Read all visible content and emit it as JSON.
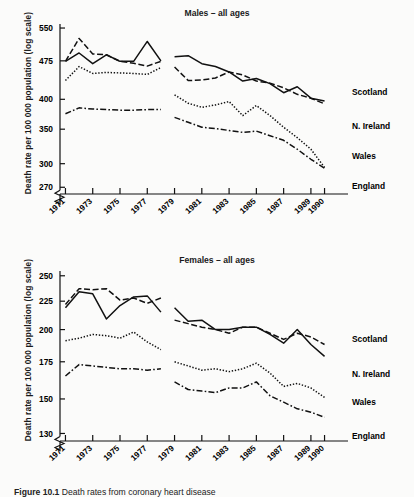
{
  "figure": {
    "caption_label": "Figure 10.1",
    "caption_text": "Death rates from coronary heart disease"
  },
  "series_styles": {
    "Scotland": "solid",
    "N. Ireland": "dashed",
    "Wales": "dotted",
    "England": "dash-dot"
  },
  "panels": {
    "males": {
      "title": "Males – all ages",
      "ylabel": "Death rate per 100 000 population (log scale)",
      "series_labels": [
        "Scotland",
        "N. Ireland",
        "Wales",
        "England"
      ]
    },
    "females": {
      "title": "Females – all ages",
      "ylabel": "Death rate per 100 000 population (log scale)",
      "series_labels": [
        "Scotland",
        "N. Ireland",
        "Wales",
        "England"
      ]
    }
  },
  "chart_data": [
    {
      "type": "line",
      "title": "Males – all ages",
      "xlabel": "",
      "ylabel": "Death rate per 100 000 population (log scale)",
      "yscale": "log",
      "ylim": [
        262,
        560
      ],
      "yticks": [
        270,
        300,
        350,
        400,
        475,
        550
      ],
      "axis_break": true,
      "grid": false,
      "legend": "inline-right",
      "xlim": [
        1970.6,
        1990.4
      ],
      "xticks": [
        1971,
        1973,
        1975,
        1977,
        1979,
        1981,
        1983,
        1985,
        1987,
        1989,
        1990
      ],
      "x": [
        1971,
        1972,
        1973,
        1974,
        1975,
        1976,
        1977,
        1978,
        1979,
        1980,
        1981,
        1982,
        1983,
        1984,
        1985,
        1986,
        1987,
        1988,
        1989,
        1990
      ],
      "data_gap_between": [
        1978,
        1979
      ],
      "series": [
        {
          "name": "Scotland",
          "style": "solid",
          "values": [
            474,
            492,
            469,
            484,
            488,
            473,
            474,
            474,
            518,
            480,
            475,
            483,
            484,
            486,
            465,
            486,
            479,
            484,
            469,
            473,
            463,
            462,
            452,
            434,
            432,
            439,
            429,
            412,
            423,
            402,
            397,
            409,
            396,
            386,
            380,
            376
          ]
        },
        {
          "name": "N. Ireland",
          "style": "dashed",
          "values": [
            474,
            500,
            525,
            500,
            490,
            480,
            488,
            480,
            474,
            470,
            464,
            474,
            466,
            462,
            462,
            474,
            465,
            442,
            433,
            436,
            440,
            435,
            452,
            451,
            446,
            440,
            434,
            430,
            430,
            421,
            424,
            409,
            402,
            400,
            392,
            378
          ]
        },
        {
          "name": "Wales",
          "style": "dotted",
          "values": [
            435,
            455,
            463,
            459,
            449,
            450,
            451,
            450,
            449,
            444,
            447,
            445,
            452,
            461,
            408,
            404,
            393,
            381,
            386,
            390,
            396,
            398,
            372,
            371,
            389,
            380,
            372,
            362,
            353,
            345,
            337,
            329,
            320,
            310,
            300,
            295
          ]
        },
        {
          "name": "England",
          "style": "dash-dot",
          "values": [
            375,
            381,
            385,
            384,
            383,
            383,
            382,
            382,
            382,
            381,
            380,
            381,
            381,
            382,
            369,
            365,
            361,
            357,
            353,
            352,
            351,
            350,
            348,
            347,
            345,
            347,
            345,
            340,
            333,
            327,
            320,
            314,
            306,
            300,
            294,
            288
          ]
        }
      ],
      "series_values_by_year": {
        "Scotland": {
          "1971": 474,
          "1972": 492,
          "1973": 469,
          "1974": 488,
          "1975": 474,
          "1976": 474,
          "1977": 518,
          "1978": 475,
          "1979": 484,
          "1980": 486,
          "1981": 469,
          "1982": 463,
          "1983": 452,
          "1984": 434,
          "1985": 439,
          "1986": 429,
          "1987": 412,
          "1988": 423,
          "1989": 402,
          "1990": 397
        },
        "N. Ireland": {
          "1971": 474,
          "1972": 525,
          "1973": 490,
          "1974": 488,
          "1975": 474,
          "1976": 470,
          "1977": 464,
          "1978": 474,
          "1979": 462,
          "1980": 435,
          "1981": 436,
          "1982": 440,
          "1983": 452,
          "1984": 446,
          "1985": 434,
          "1986": 430,
          "1987": 421,
          "1988": 409,
          "1989": 402,
          "1990": 392
        },
        "Wales": {
          "1971": 435,
          "1972": 463,
          "1973": 449,
          "1974": 451,
          "1975": 450,
          "1976": 449,
          "1977": 447,
          "1978": 461,
          "1979": 408,
          "1980": 393,
          "1981": 386,
          "1982": 390,
          "1983": 396,
          "1984": 372,
          "1985": 389,
          "1986": 372,
          "1987": 353,
          "1988": 337,
          "1989": 320,
          "1990": 295
        },
        "England": {
          "1971": 375,
          "1972": 385,
          "1973": 383,
          "1974": 382,
          "1975": 381,
          "1976": 381,
          "1977": 382,
          "1978": 382,
          "1979": 369,
          "1980": 361,
          "1981": 353,
          "1982": 351,
          "1983": 348,
          "1984": 345,
          "1985": 347,
          "1986": 340,
          "1987": 333,
          "1988": 320,
          "1989": 306,
          "1990": 294
        }
      }
    },
    {
      "type": "line",
      "title": "Females – all ages",
      "xlabel": "",
      "ylabel": "Death rate per 100 000 population (log scale)",
      "yscale": "log",
      "ylim": [
        126,
        255
      ],
      "yticks": [
        130,
        150,
        175,
        200,
        225,
        250
      ],
      "axis_break": true,
      "grid": false,
      "legend": "inline-right",
      "xlim": [
        1970.6,
        1990.4
      ],
      "xticks": [
        1971,
        1973,
        1975,
        1977,
        1979,
        1981,
        1983,
        1985,
        1987,
        1989,
        1990
      ],
      "x": [
        1971,
        1972,
        1973,
        1974,
        1975,
        1976,
        1977,
        1978,
        1979,
        1980,
        1981,
        1982,
        1983,
        1984,
        1985,
        1986,
        1987,
        1988,
        1989,
        1990
      ],
      "data_gap_between": [
        1978,
        1979
      ],
      "series": [
        {
          "name": "Scotland",
          "style": "solid",
          "values": [
            219,
            234,
            232,
            209,
            221,
            229,
            230,
            215,
            219,
            207,
            208,
            200,
            200,
            202,
            196,
            189,
            200,
            188,
            179
          ]
        },
        {
          "name": "N. Ireland",
          "style": "dashed",
          "values": [
            222,
            237,
            236,
            237,
            226,
            228,
            223,
            228,
            208,
            205,
            202,
            200,
            197,
            202,
            197,
            192,
            194,
            188
          ]
        },
        {
          "name": "Wales",
          "style": "dotted",
          "values": [
            191,
            193,
            196,
            195,
            193,
            198,
            190,
            184,
            175,
            172,
            169,
            170,
            168,
            174,
            167,
            158,
            160,
            151
          ]
        },
        {
          "name": "England",
          "style": "dash-dot",
          "values": [
            165,
            173,
            172,
            171,
            170,
            170,
            169,
            170,
            161,
            156,
            155,
            154,
            157,
            157,
            161,
            152,
            148,
            144,
            139
          ]
        }
      ],
      "series_values_by_year": {
        "Scotland": {
          "1971": 219,
          "1972": 234,
          "1973": 232,
          "1974": 209,
          "1975": 221,
          "1976": 229,
          "1977": 230,
          "1978": 215,
          "1979": 219,
          "1980": 207,
          "1981": 208,
          "1982": 200,
          "1983": 200,
          "1984": 202,
          "1985": 202,
          "1986": 196,
          "1987": 189,
          "1988": 200,
          "1989": 188,
          "1990": 179
        },
        "N. Ireland": {
          "1971": 222,
          "1972": 237,
          "1973": 236,
          "1974": 237,
          "1975": 226,
          "1976": 228,
          "1977": 223,
          "1978": 228,
          "1979": 208,
          "1980": 205,
          "1981": 202,
          "1982": 200,
          "1983": 197,
          "1984": 202,
          "1985": 202,
          "1986": 197,
          "1987": 192,
          "1988": 197,
          "1989": 194,
          "1990": 188
        },
        "Wales": {
          "1971": 191,
          "1972": 193,
          "1973": 196,
          "1974": 195,
          "1975": 193,
          "1976": 198,
          "1977": 190,
          "1978": 184,
          "1979": 175,
          "1980": 172,
          "1981": 169,
          "1982": 170,
          "1983": 168,
          "1984": 170,
          "1985": 174,
          "1986": 167,
          "1987": 158,
          "1988": 160,
          "1989": 157,
          "1990": 151
        },
        "England": {
          "1971": 165,
          "1972": 173,
          "1973": 172,
          "1974": 171,
          "1975": 170,
          "1976": 170,
          "1977": 169,
          "1978": 170,
          "1979": 161,
          "1980": 156,
          "1981": 155,
          "1982": 154,
          "1983": 157,
          "1984": 157,
          "1985": 161,
          "1986": 152,
          "1987": 148,
          "1988": 144,
          "1989": 142,
          "1990": 139
        }
      }
    }
  ]
}
